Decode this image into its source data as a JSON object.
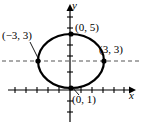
{
  "figure": {
    "background_color": "#ffffff",
    "stroke_color": "#000000",
    "width": 142,
    "height": 128
  },
  "axes": {
    "x_label": "x",
    "y_label": "y",
    "origin": {
      "x": 70,
      "y": 90
    },
    "unit_px": 11,
    "x_axis": {
      "start_x": 8,
      "end_x": 132,
      "y": 90,
      "arrow": "right"
    },
    "y_axis": {
      "start_y": 122,
      "end_y": 4,
      "x": 70,
      "arrow": "up"
    },
    "x_ticks_left": 6,
    "x_ticks_right": 5,
    "y_ticks_up": 7,
    "y_ticks_down": 3,
    "tick_half_length": 3
  },
  "ellipse": {
    "center": {
      "x": 0,
      "y": 3
    },
    "semi_major_horizontal": 3,
    "semi_minor_vertical": 2,
    "stroke_width": 2.2,
    "pixel_center": {
      "cx": 71,
      "cy": 61
    },
    "pixel_rx": 33,
    "pixel_ry": 27
  },
  "major_axis_line": {
    "style": "dashed",
    "y_value": 3,
    "pixel_y": 61,
    "start_x": 2,
    "end_x": 140,
    "dash_pattern": "4 3"
  },
  "points": [
    {
      "name": "left-vertex",
      "label": "(−3, 3)",
      "x": -3,
      "y": 3,
      "pixel": {
        "x": 38,
        "y": 61
      },
      "leader": true
    },
    {
      "name": "top-vertex",
      "label": "(0, 5)",
      "x": 0,
      "y": 5,
      "pixel": {
        "x": 71,
        "y": 34
      },
      "leader": false
    },
    {
      "name": "right-vertex",
      "label": "(3, 3)",
      "x": 3,
      "y": 3,
      "pixel": {
        "x": 104,
        "y": 61
      },
      "leader": false
    },
    {
      "name": "bottom-vertex",
      "label": "(0, 1)",
      "x": 0,
      "y": 1,
      "pixel": {
        "x": 71,
        "y": 88
      },
      "leader": true
    }
  ],
  "leader_lines": [
    {
      "name": "leader-left",
      "from": {
        "x": 30,
        "y": 42
      },
      "to": {
        "x": 39,
        "y": 60
      }
    },
    {
      "name": "leader-bottom",
      "from": {
        "x": 79,
        "y": 95
      },
      "to": {
        "x": 72,
        "y": 87
      }
    }
  ]
}
